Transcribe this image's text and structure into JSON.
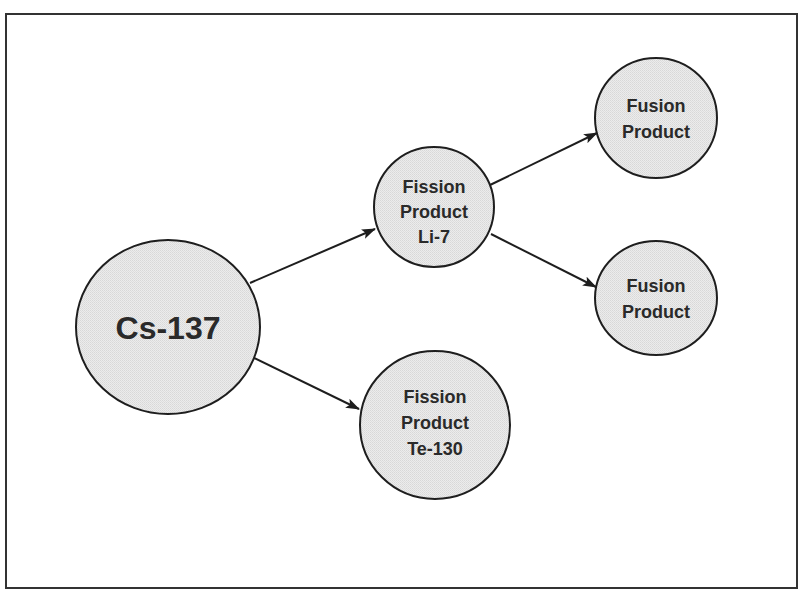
{
  "diagram": {
    "type": "decay-tree",
    "colors": {
      "frame": "#333333",
      "node_fill": "#e6e6e6",
      "node_stroke": "#1e1e1e",
      "text": "#2a2a2a",
      "edge": "#1e1e1e"
    },
    "nodes": [
      {
        "id": "cs137",
        "lines": [
          "Cs-137"
        ]
      },
      {
        "id": "li7",
        "lines": [
          "Fission",
          "Product",
          "Li-7"
        ]
      },
      {
        "id": "te130",
        "lines": [
          "Fission",
          "Product",
          "Te-130"
        ]
      },
      {
        "id": "fusion1",
        "lines": [
          "Fusion",
          "Product"
        ]
      },
      {
        "id": "fusion2",
        "lines": [
          "Fusion",
          "Product"
        ]
      }
    ],
    "edges": [
      {
        "from": "cs137",
        "to": "li7"
      },
      {
        "from": "cs137",
        "to": "te130"
      },
      {
        "from": "li7",
        "to": "fusion1"
      },
      {
        "from": "li7",
        "to": "fusion2"
      }
    ]
  }
}
